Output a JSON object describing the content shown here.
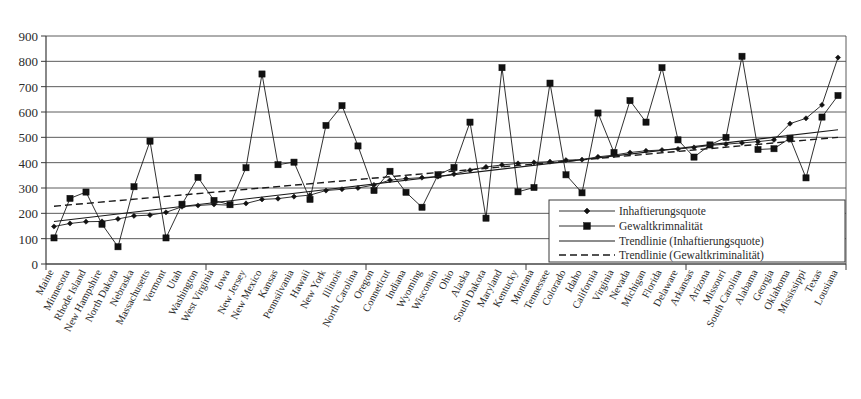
{
  "chart_data": {
    "type": "line",
    "title": "",
    "xlabel": "",
    "ylabel": "",
    "ylim": [
      0,
      900
    ],
    "ytick_step": 100,
    "yticks": [
      "0",
      "100",
      "200",
      "300",
      "400",
      "500",
      "600",
      "700",
      "800",
      "900"
    ],
    "grid": true,
    "legend_position": "bottom-right",
    "legend": [
      "Inhaftierungsquote",
      "Gewaltkrimnalität",
      "Trendlinie (Inhaftierungsquote)",
      "Trendlinie (Gewaltkriminalität)"
    ],
    "categories": [
      "Maine",
      "Minnesota",
      "Rhode Island",
      "New Hampshire",
      "North Dakota",
      "Nebraska",
      "Massachusetts",
      "Vermont",
      "Utah",
      "Washington",
      "West Virginia",
      "Iowa",
      "New Jersey",
      "New Mexico",
      "Kansas",
      "Pennsilvania",
      "Hawaii",
      "New York",
      "Illinois",
      "North Carolina",
      "Oregon",
      "Conneticut",
      "Indiana",
      "Wyoming",
      "Wisconsin",
      "Ohio",
      "Alaska",
      "South Dakota",
      "Maryland",
      "Kentucky",
      "Montana",
      "Tennessee",
      "Colorado",
      "Idaho",
      "California",
      "Virginia",
      "Nevada",
      "Michigan",
      "Florida",
      "Delaware",
      "Arkansas",
      "Arizona",
      "Missouri",
      "South Carolina",
      "Alabama",
      "Georgia",
      "Oklahoma",
      "Mississippi",
      "Texas",
      "Lousiana"
    ],
    "series": [
      {
        "name": "Inhaftierungsquote",
        "marker": "diamond",
        "values": [
          148,
          160,
          167,
          168,
          178,
          190,
          193,
          204,
          226,
          231,
          235,
          232,
          239,
          255,
          258,
          266,
          272,
          290,
          295,
          300,
          312,
          331,
          337,
          341,
          345,
          355,
          370,
          383,
          391,
          397,
          401,
          404,
          410,
          412,
          423,
          430,
          440,
          447,
          450,
          454,
          460,
          468,
          473,
          478,
          483,
          490,
          554,
          575,
          628,
          815
        ]
      },
      {
        "name": "Gewaltkrimnalität",
        "marker": "square",
        "values": [
          103,
          259,
          284,
          157,
          68,
          305,
          485,
          103,
          236,
          342,
          251,
          234,
          380,
          750,
          392,
          402,
          255,
          547,
          625,
          466,
          290,
          366,
          283,
          224,
          352,
          381,
          560,
          181,
          775,
          285,
          302,
          714,
          352,
          281,
          596,
          440,
          645,
          560,
          775,
          490,
          422,
          470,
          500,
          820,
          452,
          455,
          497,
          340,
          580,
          665
        ]
      }
    ],
    "trendlines": [
      {
        "name": "Trendlinie (Inhaftierungsquote)",
        "style": "solid",
        "start": 168,
        "end": 530
      },
      {
        "name": "Trendlinie (Gewaltkriminalität)",
        "style": "dashed",
        "start": 228,
        "end": 500
      }
    ]
  }
}
